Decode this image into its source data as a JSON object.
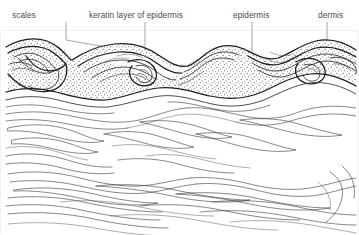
{
  "figure": {
    "background_color": "#ffffff",
    "ink_color": "#1d1d1d",
    "leader_color": "#808080",
    "label_color": "#4a4a4a",
    "width": 359,
    "height": 235
  },
  "labels": [
    {
      "id": "scales",
      "text": "scales",
      "x": 12,
      "y": 18,
      "anchor": "start",
      "leader_path": "M 66 22 L 66 40 L 152 55"
    },
    {
      "id": "keratin-layer-of-epidermis",
      "text": "keratin layer of  epidermis",
      "x": 89,
      "y": 18,
      "anchor": "start",
      "leader_path": "M 145 22 L 145 52"
    },
    {
      "id": "epidermis",
      "text": "epidermis",
      "x": 233,
      "y": 18,
      "anchor": "start",
      "leader_path": "M 252 22 L 252 58 L 266 66"
    },
    {
      "id": "dermis",
      "text": "dermis",
      "x": 318,
      "y": 18,
      "anchor": "start",
      "leader_path": "M 327 22 L 327 60"
    }
  ],
  "regions": [
    {
      "id": "scale-layer",
      "name": "scales",
      "description": "overlapping keratinised scale outlines along the upper surface"
    },
    {
      "id": "keratin-layer",
      "name": "keratin layer of epidermis",
      "description": "stippled band following the scale contours"
    },
    {
      "id": "epidermis-layer",
      "name": "epidermis",
      "description": "stippled cellular band beneath the keratin layer"
    },
    {
      "id": "dermis-layer",
      "name": "dermis",
      "description": "lower zone of long wavy collagen fibre bundles"
    }
  ]
}
